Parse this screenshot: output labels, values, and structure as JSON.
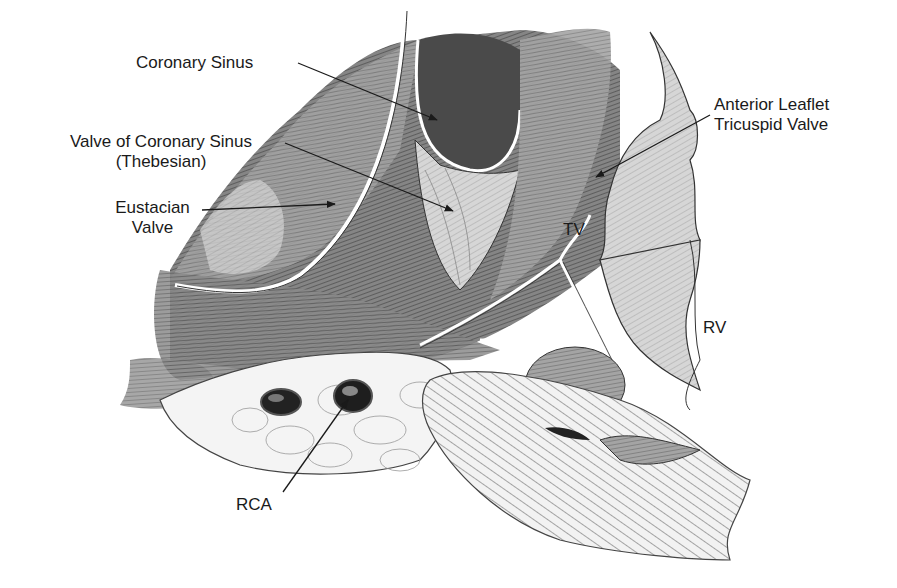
{
  "figure": {
    "type": "anatomical illustration"
  },
  "labels": {
    "coronary_sinus": "Coronary Sinus",
    "valve_cs_line1": "Valve of Coronary Sinus",
    "valve_cs_line2": "(Thebesian)",
    "eustacian_line1": "Eustacian",
    "eustacian_line2": "Valve",
    "anterior_line1": "Anterior Leaflet",
    "anterior_line2": "Tricuspid Valve",
    "tv": "TV",
    "rv": "RV",
    "rca": "RCA"
  },
  "colors": {
    "ink": "#1a1a1a",
    "tissue_dark": "#5a5a5a",
    "tissue_mid": "#8c8c8c",
    "tissue_light": "#c8c8c8",
    "background": "#ffffff"
  }
}
